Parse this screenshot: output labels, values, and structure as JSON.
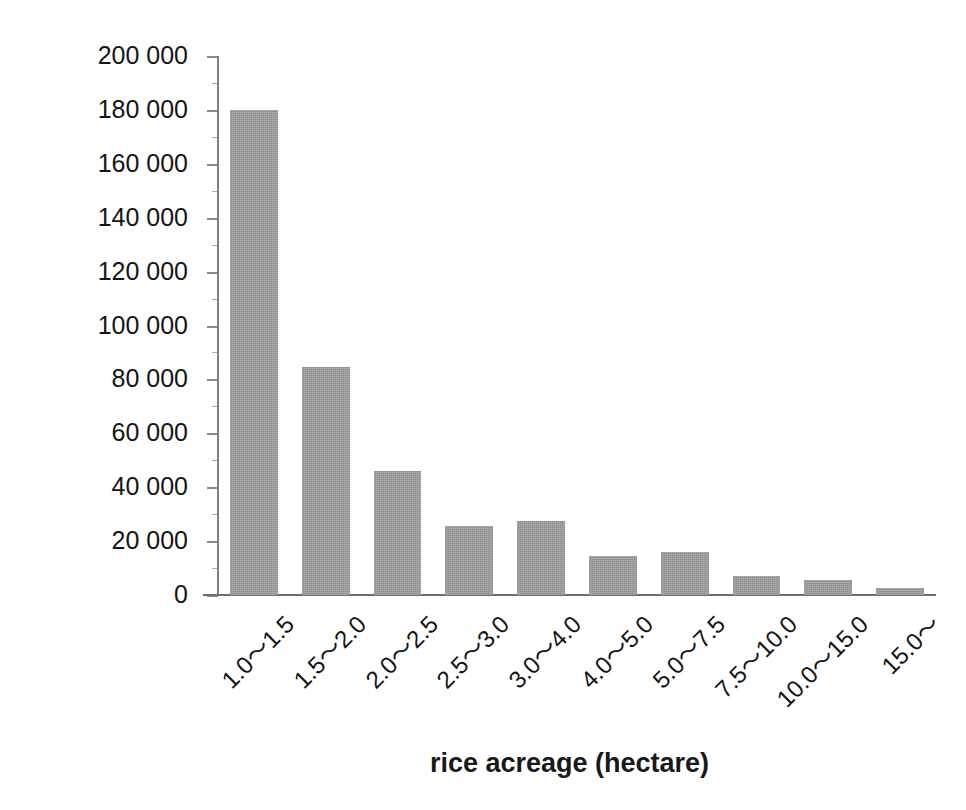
{
  "chart_data": {
    "type": "bar",
    "title": "",
    "subtitle": "",
    "xlabel": "rice acreage (hectare)",
    "ylabel": "number of houses",
    "categories": [
      "1.0〜1.5",
      "1.5〜2.0",
      "2.0〜2.5",
      "2.5〜3.0",
      "3.0〜4.0",
      "4.0〜5.0",
      "5.0〜7.5",
      "7.5〜10.0",
      "10.0〜15.0",
      "15.0〜"
    ],
    "values": [
      180000,
      84500,
      46000,
      25500,
      27500,
      14500,
      16000,
      7000,
      5500,
      2500
    ],
    "ylim": [
      0,
      200000
    ],
    "ytick_values": [
      0,
      20000,
      40000,
      60000,
      80000,
      100000,
      120000,
      140000,
      160000,
      180000,
      200000
    ],
    "ytick_labels": [
      "0",
      "20 000",
      "40 000",
      "60 000",
      "80 000",
      "100 000",
      "120 000",
      "140 000",
      "160 000",
      "180 000",
      "200 000"
    ],
    "yminor_interval": 10000,
    "grid": false,
    "legend": null,
    "legend_position": "none",
    "bar_color": "#9a9a9a",
    "axis_color": "#808080",
    "text_color": "#191919",
    "background": "#ffffff",
    "annotations": []
  }
}
